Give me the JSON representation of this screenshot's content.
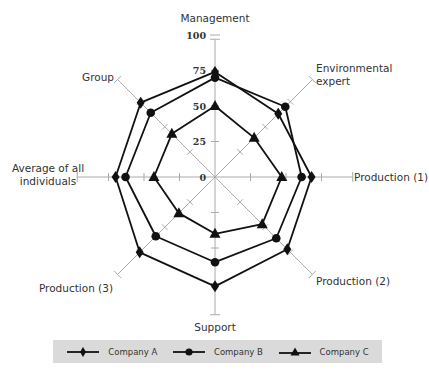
{
  "chart_data": {
    "type": "radar",
    "title": "",
    "categories": [
      "Management",
      "Environmental expert",
      "Production (1)",
      "Production (2)",
      "Support",
      "Production (3)",
      "Average of all individuals",
      "Group"
    ],
    "category_labels": [
      [
        "Management"
      ],
      [
        "Environmental",
        "expert"
      ],
      [
        "Production (1)"
      ],
      [
        "Production (2)"
      ],
      [
        "Support"
      ],
      [
        "Production (3)"
      ],
      [
        "Average of all",
        "individuals"
      ],
      [
        "Group"
      ]
    ],
    "radial_ticks": [
      0,
      25,
      50,
      75,
      100
    ],
    "rlim": [
      0,
      100
    ],
    "grid": false,
    "legend_position": "bottom",
    "series": [
      {
        "name": "Company A",
        "marker": "diamond",
        "values": [
          74,
          63,
          68,
          72,
          77,
          75,
          70,
          74
        ]
      },
      {
        "name": "Company B",
        "marker": "circle",
        "values": [
          70,
          70,
          61,
          61,
          60,
          59,
          63,
          64
        ]
      },
      {
        "name": "Company C",
        "marker": "triangle",
        "values": [
          50,
          39,
          47,
          47,
          40,
          36,
          43,
          43
        ]
      }
    ]
  },
  "legend": {
    "items": [
      {
        "label": "Company A",
        "marker": "diamond"
      },
      {
        "label": "Company B",
        "marker": "circle"
      },
      {
        "label": "Company C",
        "marker": "triangle"
      }
    ]
  },
  "colors": {
    "series_line": "#111111",
    "axis_line": "#aaaaaa",
    "legend_bg": "#dadada"
  }
}
